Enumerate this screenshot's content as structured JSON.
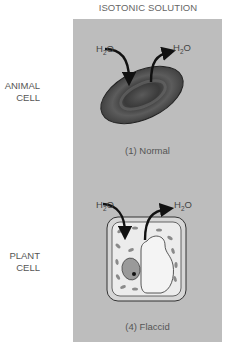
{
  "title": "ISOTONIC SOLUTION",
  "rows": [
    {
      "label_line1": "ANIMAL",
      "label_line2": "CELL",
      "caption": "(1) Normal",
      "water_in": {
        "main": "H",
        "sub": "2",
        "tail": "O"
      },
      "water_out": {
        "main": "H",
        "sub": "2",
        "tail": "O"
      }
    },
    {
      "label_line1": "PLANT",
      "label_line2": "CELL",
      "caption": "(4) Flaccid",
      "water_in": {
        "main": "H",
        "sub": "2",
        "tail": "O"
      },
      "water_out": {
        "main": "H",
        "sub": "2",
        "tail": "O"
      }
    }
  ],
  "colors": {
    "panel": "#bdbdbd",
    "red_blood_cell": "#4a4a4a",
    "plant_cytoplasm": "#e6e6e6",
    "vacuole": "#f2f2f2",
    "chloroplast": "#8a8a8a",
    "arrow": "#111111"
  },
  "icons": [
    "red-blood-cell-icon",
    "plant-cell-icon",
    "water-in-arrow-icon",
    "water-out-arrow-icon"
  ]
}
